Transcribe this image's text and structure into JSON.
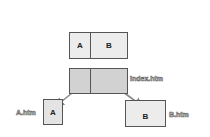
{
  "diagram": {
    "top_frameset": {
      "left": "A",
      "right": "B"
    },
    "index_frameset": {
      "label": "index.htm"
    },
    "page_a": {
      "content": "A",
      "label": "A.htm"
    },
    "page_b": {
      "content": "B",
      "label": "B.htm"
    }
  },
  "colors": {
    "light_fill": "#ececec",
    "dark_fill": "#d2d2d2",
    "border": "#555555",
    "arrow": "#8a8a8a"
  }
}
